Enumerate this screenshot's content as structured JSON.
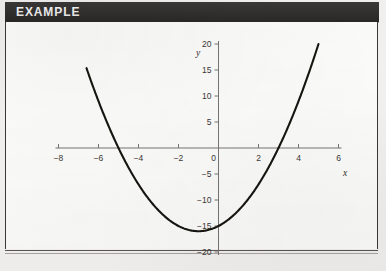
{
  "header": {
    "label": "EXAMPLE",
    "background_color": "#2f2d2c",
    "text_color": "#ffffff"
  },
  "page": {
    "background_color": "#f2f1ef",
    "panel_color": "#fdfdfc",
    "border_color": "#3a3836"
  },
  "chart_data": {
    "type": "line",
    "title": "",
    "subtitle": "",
    "xlabel": "x",
    "ylabel": "y",
    "xlim": [
      -8,
      6
    ],
    "ylim": [
      -20,
      20
    ],
    "xticks": [
      -8,
      -6,
      -4,
      -2,
      0,
      2,
      4,
      6
    ],
    "xticklabels": [
      "−8",
      "−6",
      "−4",
      "−2",
      "0",
      "2",
      "4",
      "6"
    ],
    "yticks": [
      -20,
      -15,
      -10,
      -5,
      0,
      5,
      10,
      15,
      20
    ],
    "yticklabels": [
      "−20",
      "−15",
      "−10",
      "−5",
      "0",
      "5",
      "10",
      "15",
      "20"
    ],
    "grid": false,
    "legend": null,
    "axis_style": "crossed-at-origin",
    "series": [
      {
        "name": "parabola",
        "equation": "y = x^2 + 2x - 15",
        "color": "#17150f",
        "linewidth": 2.1,
        "domain": [
          -6.6,
          5.0
        ],
        "vertex": [
          -1,
          -16
        ],
        "roots": [
          -5,
          3
        ],
        "x": [
          -6.6,
          -6.2,
          -5.8,
          -5.4,
          -5.0,
          -4.6,
          -4.2,
          -3.8,
          -3.4,
          -3.0,
          -2.6,
          -2.2,
          -1.8,
          -1.4,
          -1.0,
          -0.6,
          -0.2,
          0.2,
          0.6,
          1.0,
          1.4,
          1.8,
          2.2,
          2.6,
          3.0,
          3.4,
          3.8,
          4.2,
          4.6,
          5.0
        ],
        "y": [
          15.36,
          10.84,
          6.24,
          4.36,
          0.0,
          -3.04,
          -5.96,
          -8.16,
          -10.64,
          -12.0,
          -13.44,
          -14.56,
          -15.36,
          -15.84,
          -16.0,
          -15.84,
          -15.36,
          -14.56,
          -13.44,
          -12.0,
          -10.24,
          -8.16,
          -5.76,
          -3.04,
          0.0,
          3.36,
          7.04,
          11.04,
          15.36,
          20.0
        ]
      }
    ]
  }
}
